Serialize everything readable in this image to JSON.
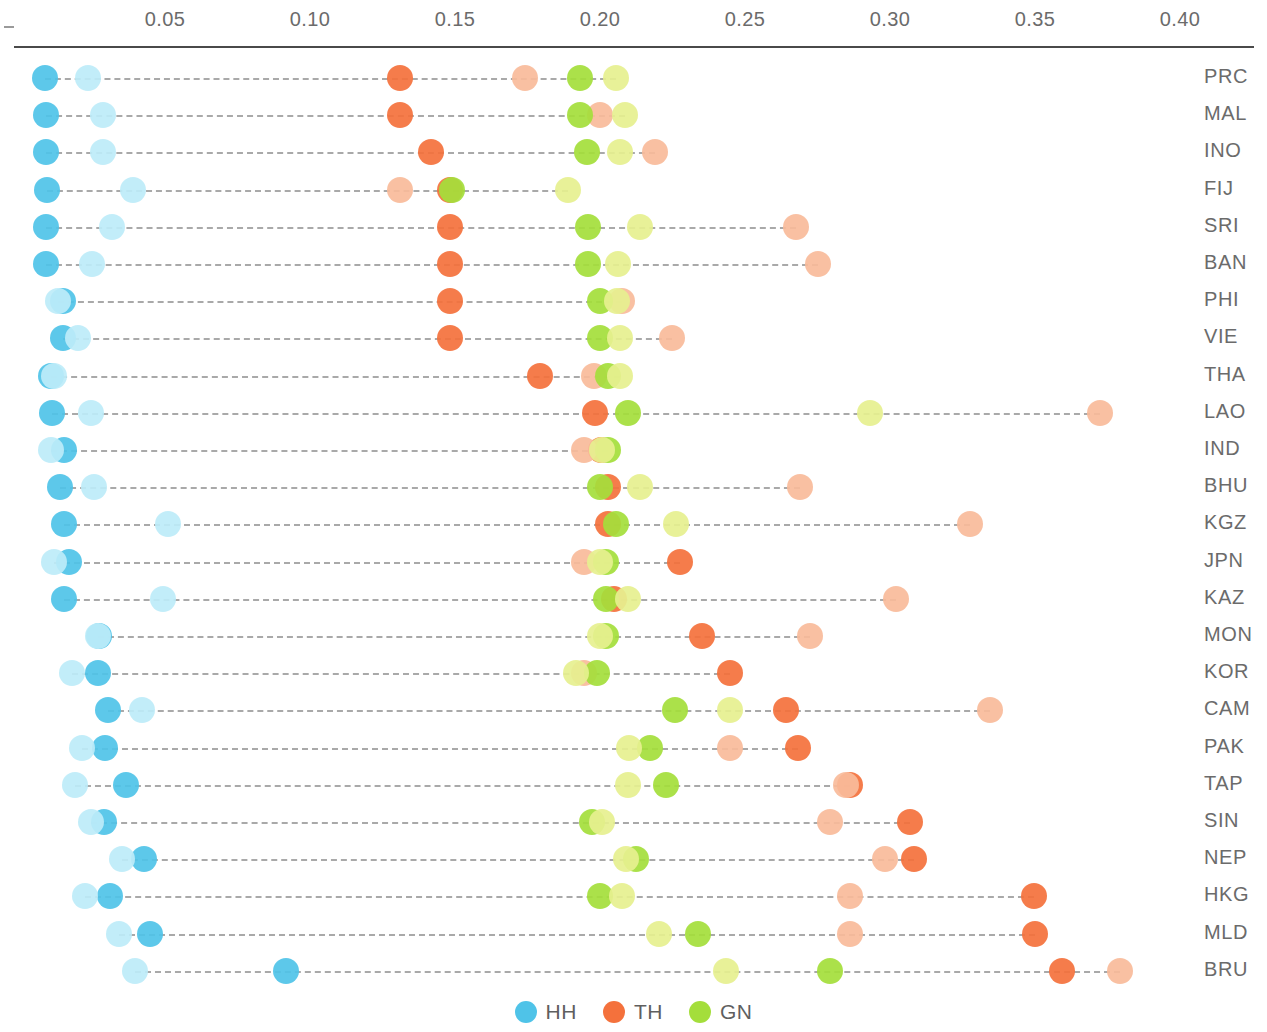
{
  "chart_data": {
    "type": "scatter",
    "subtype": "dot-plot",
    "title": "",
    "xlabel": "",
    "ylabel": "",
    "xlim": [
      0.0,
      0.41
    ],
    "xticks": [
      0.05,
      0.1,
      0.15,
      0.2,
      0.25,
      0.3,
      0.35,
      0.4
    ],
    "xtick_labels": [
      "0.05",
      "0.10",
      "0.15",
      "0.20",
      "0.25",
      "0.30",
      "0.35",
      "0.40"
    ],
    "grid": false,
    "legend_position": "bottom-center",
    "axis_origin_dash": "-",
    "categories": [
      "PRC",
      "MAL",
      "INO",
      "FIJ",
      "SRI",
      "BAN",
      "PHI",
      "VIE",
      "THA",
      "LAO",
      "IND",
      "BHU",
      "KGZ",
      "JPN",
      "KAZ",
      "MON",
      "KOR",
      "CAM",
      "PAK",
      "TAP",
      "SIN",
      "NEP",
      "HKG",
      "MLD",
      "BRU"
    ],
    "series": [
      {
        "name": "HH",
        "key": "hh",
        "color": "#4FC3E8",
        "label": "HH",
        "legend": true,
        "values": [
          0.0086,
          0.009,
          0.009,
          0.0093,
          0.009,
          0.009,
          0.0148,
          0.0148,
          0.0107,
          0.011,
          0.0152,
          0.0138,
          0.0152,
          0.0169,
          0.0152,
          0.0272,
          0.0269,
          0.0304,
          0.0293,
          0.0366,
          0.029,
          0.0428,
          0.031,
          0.0448,
          0.0917
        ]
      },
      {
        "name": "HH-light",
        "key": "hh_l",
        "color": "#BDEBF8",
        "label": "HH light",
        "legend": false,
        "values": [
          0.0234,
          0.0286,
          0.0286,
          0.039,
          0.0317,
          0.0248,
          0.0131,
          0.02,
          0.0117,
          0.0245,
          0.0107,
          0.0255,
          0.051,
          0.0117,
          0.0493,
          0.0269,
          0.0179,
          0.0421,
          0.0214,
          0.019,
          0.0245,
          0.0352,
          0.0224,
          0.0341,
          0.0397
        ]
      },
      {
        "name": "TH",
        "key": "th",
        "color": "#F4713C",
        "label": "TH",
        "legend": true,
        "values": [
          0.131,
          0.131,
          0.1417,
          0.1483,
          0.1483,
          0.1483,
          0.1483,
          0.1483,
          0.1793,
          0.1983,
          0.2003,
          0.2028,
          0.2028,
          0.2276,
          0.2048,
          0.2352,
          0.2448,
          0.2641,
          0.2683,
          0.2862,
          0.3069,
          0.3083,
          0.3497,
          0.35,
          0.3593
        ]
      },
      {
        "name": "TH-light",
        "key": "th_l",
        "color": "#F8BB9A",
        "label": "TH light",
        "legend": false,
        "values": [
          0.1741,
          0.2,
          0.219,
          0.131,
          0.2676,
          0.2752,
          0.2076,
          0.2248,
          0.1979,
          0.3724,
          0.1945,
          0.269,
          0.3276,
          0.1945,
          0.3021,
          0.2724,
          0.1945,
          0.3345,
          0.2448,
          0.2848,
          0.2793,
          0.2983,
          0.2862,
          0.2862,
          0.3793
        ]
      },
      {
        "name": "GN",
        "key": "gn",
        "color": "#A4DE3B",
        "label": "GN",
        "legend": true,
        "values": [
          0.1931,
          0.1931,
          0.1955,
          0.149,
          0.1959,
          0.1959,
          0.2,
          0.2,
          0.2028,
          0.2097,
          0.2028,
          0.2,
          0.2055,
          0.2021,
          0.2021,
          0.2021,
          0.199,
          0.2259,
          0.2172,
          0.2228,
          0.1972,
          0.2124,
          0.2,
          0.2338,
          0.2793
        ]
      },
      {
        "name": "GN-light",
        "key": "gn_l",
        "color": "#E6F08F",
        "label": "GN light",
        "legend": false,
        "values": [
          0.2055,
          0.2086,
          0.2069,
          0.189,
          0.2138,
          0.2062,
          0.2059,
          0.2069,
          0.2069,
          0.2931,
          0.2007,
          0.2138,
          0.2262,
          0.2,
          0.2097,
          0.2,
          0.1917,
          0.2448,
          0.21,
          0.2097,
          0.2007,
          0.209,
          0.2076,
          0.2203,
          0.2434
        ]
      }
    ],
    "legend_entries": [
      {
        "label": "HH",
        "color": "#4FC3E8"
      },
      {
        "label": "TH",
        "color": "#F4713C"
      },
      {
        "label": "GN",
        "color": "#A4DE3B"
      }
    ]
  }
}
